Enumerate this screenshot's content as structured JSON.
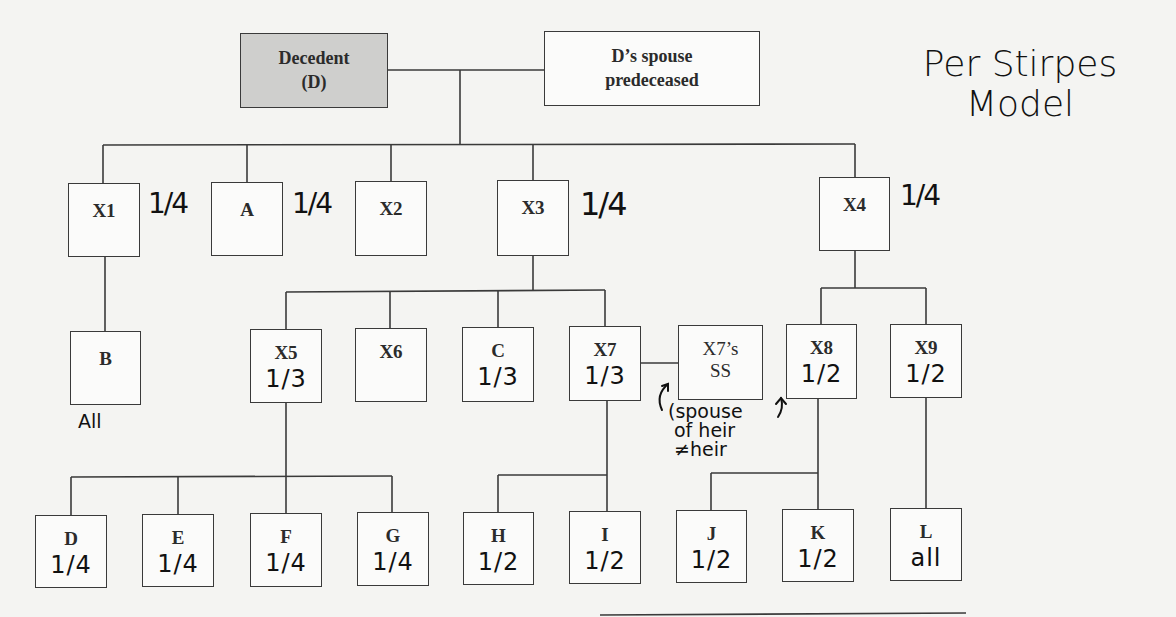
{
  "title_note": {
    "line1": "Per Stirpes",
    "line2": "Model"
  },
  "root": {
    "decedent": {
      "line1": "Decedent",
      "line2": "(D)",
      "fill": "#cfcfcd"
    },
    "spouse": {
      "line1": "D’s spouse",
      "line2": "predeceased"
    }
  },
  "generation1": [
    {
      "id": "X1",
      "label": "X1",
      "share": "1/4"
    },
    {
      "id": "A",
      "label": "A",
      "share": "1/4"
    },
    {
      "id": "X2",
      "label": "X2",
      "share": ""
    },
    {
      "id": "X3",
      "label": "X3",
      "share": "1/4"
    },
    {
      "id": "X4",
      "label": "X4",
      "share": "1/4"
    }
  ],
  "generation2": [
    {
      "id": "B",
      "label": "B",
      "share": "All",
      "parent": "X1"
    },
    {
      "id": "X5",
      "label": "X5",
      "share": "1/3",
      "parent": "X3"
    },
    {
      "id": "X6",
      "label": "X6",
      "share": "",
      "parent": "X3"
    },
    {
      "id": "C",
      "label": "C",
      "share": "1/3",
      "parent": "X3"
    },
    {
      "id": "X7",
      "label": "X7",
      "share": "1/3",
      "parent": "X3"
    },
    {
      "id": "X7SS",
      "label_line1": "X7’s",
      "label_line2": "SS",
      "spouse_of": "X7"
    },
    {
      "id": "X8",
      "label": "X8",
      "share": "1/2",
      "parent": "X4"
    },
    {
      "id": "X9",
      "label": "X9",
      "share": "1/2",
      "parent": "X4"
    }
  ],
  "generation3": [
    {
      "id": "D",
      "label": "D",
      "share": "1/4",
      "parent": "X5"
    },
    {
      "id": "E",
      "label": "E",
      "share": "1/4",
      "parent": "X5"
    },
    {
      "id": "F",
      "label": "F",
      "share": "1/4",
      "parent": "X5"
    },
    {
      "id": "G",
      "label": "G",
      "share": "1/4",
      "parent": "X5"
    },
    {
      "id": "H",
      "label": "H",
      "share": "1/2",
      "parent": "X7"
    },
    {
      "id": "I",
      "label": "I",
      "share": "1/2",
      "parent": "X7"
    },
    {
      "id": "J",
      "label": "J",
      "share": "1/2",
      "parent": "X8"
    },
    {
      "id": "K",
      "label": "K",
      "share": "1/2",
      "parent": "X8"
    },
    {
      "id": "L",
      "label": "L",
      "share": "all",
      "parent": "X9"
    }
  ],
  "annotation": {
    "line1": "(spouse",
    "line2": "of heir",
    "line3": "≠heir"
  }
}
